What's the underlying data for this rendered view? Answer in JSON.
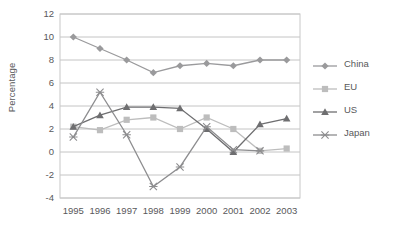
{
  "chart_data": {
    "type": "line",
    "title": "",
    "subtitle": "",
    "xlabel": "",
    "ylabel": "Percentage",
    "categories": [
      "1995",
      "1996",
      "1997",
      "1998",
      "1999",
      "2000",
      "2001",
      "2002",
      "2003"
    ],
    "x": [
      1995,
      1996,
      1997,
      1998,
      1999,
      2000,
      2001,
      2002,
      2003
    ],
    "ylim": [
      -4,
      12
    ],
    "yticks": [
      "12",
      "10",
      "8",
      "6",
      "4",
      "2",
      "0",
      "-2",
      "-4"
    ],
    "ytick_values": [
      12,
      10,
      8,
      6,
      4,
      2,
      0,
      -2,
      -4
    ],
    "grid": "horizontal",
    "legend_position": "right",
    "series": [
      {
        "name": "China",
        "marker": "diamond",
        "color": "#9a9a9c",
        "values": [
          10.0,
          9.0,
          8.0,
          6.9,
          7.5,
          7.7,
          7.5,
          8.0,
          8.0
        ]
      },
      {
        "name": "EU",
        "marker": "square",
        "color": "#bdbdbd",
        "values": [
          2.2,
          1.9,
          2.8,
          3.0,
          2.0,
          3.0,
          2.0,
          0.1,
          0.3
        ]
      },
      {
        "name": "US",
        "marker": "triangle",
        "color": "#6e6e70",
        "values": [
          2.2,
          3.2,
          3.9,
          3.9,
          3.8,
          2.0,
          0.0,
          2.4,
          2.9
        ]
      },
      {
        "name": "Japan",
        "marker": "cross",
        "color": "#8d8d8f",
        "values": [
          1.3,
          5.2,
          1.5,
          -3.0,
          -1.3,
          2.2,
          0.2,
          0.1,
          null
        ]
      }
    ]
  },
  "legend": {
    "items": [
      {
        "label": "China",
        "marker": "diamond",
        "color": "#9a9a9c"
      },
      {
        "label": "EU",
        "marker": "square",
        "color": "#bdbdbd"
      },
      {
        "label": "US",
        "marker": "triangle",
        "color": "#6e6e70"
      },
      {
        "label": "Japan",
        "marker": "cross",
        "color": "#8d8d8f"
      }
    ]
  },
  "axes": {
    "y_label": "Percentage",
    "frame_color": "#c8c8c8",
    "grid_color": "#c4c4c4",
    "text_color": "#58585a"
  }
}
